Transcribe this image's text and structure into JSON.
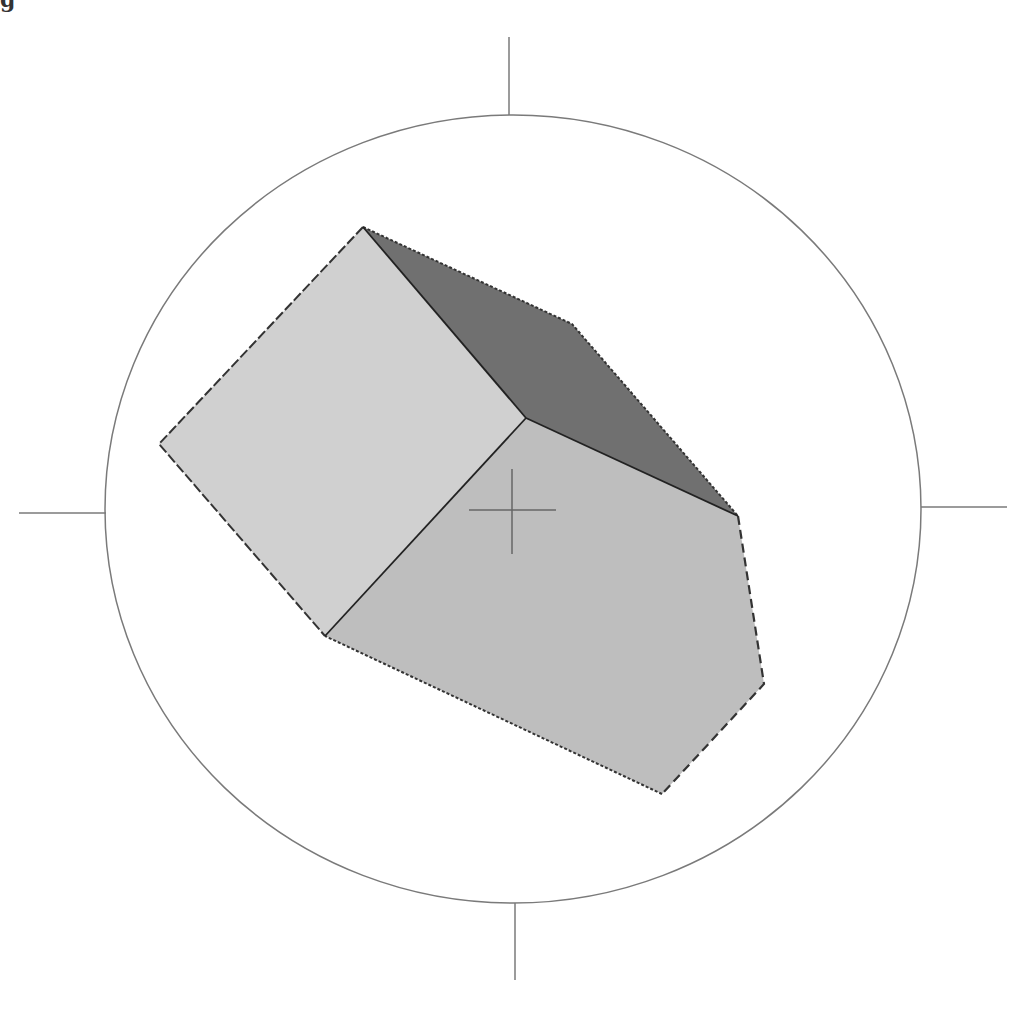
{
  "caption": "g",
  "diagram": {
    "compass": {
      "center": [
        513,
        509
      ],
      "rx": 408,
      "ry": 394,
      "ticks": {
        "north": [
          [
            509,
            37
          ],
          [
            509,
            115
          ]
        ],
        "south": [
          [
            515,
            903
          ],
          [
            515,
            980
          ]
        ],
        "west": [
          [
            19,
            513
          ],
          [
            106,
            513
          ]
        ],
        "east": [
          [
            921,
            507
          ],
          [
            1007,
            507
          ]
        ]
      },
      "stroke_color": "#7a7a7a"
    },
    "crosshair": {
      "center": [
        512,
        510
      ],
      "half_length": 43,
      "color": "#666666"
    },
    "faces": [
      {
        "name": "left-face",
        "points": "363,227 526,418 325,636 159,444",
        "fill": "#d0d0d0"
      },
      {
        "name": "top-face",
        "points": "363,227 572,324 738,516 526,418",
        "fill": "#707070"
      },
      {
        "name": "front-face",
        "points": "526,418 738,516 764,684 662,794 325,636",
        "fill": "#bebebe"
      }
    ],
    "edge_color": "#333333"
  }
}
